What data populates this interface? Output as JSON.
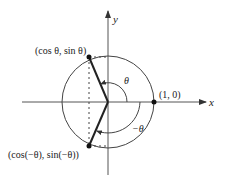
{
  "diagram": {
    "type": "unit-circle-symmetry",
    "axes": {
      "x_label": "x",
      "y_label": "y"
    },
    "points": {
      "p_theta": {
        "label": "(cos θ, sin θ)"
      },
      "p_neg_theta": {
        "label": "(cos(−θ),  sin(−θ))"
      },
      "p_one": {
        "label": "(1, 0)"
      }
    },
    "angles": {
      "theta": {
        "label": "θ"
      },
      "neg_theta": {
        "label": "−θ"
      }
    }
  },
  "colors": {
    "stroke": "#333333",
    "text": "#222222",
    "background": "#ffffff"
  }
}
